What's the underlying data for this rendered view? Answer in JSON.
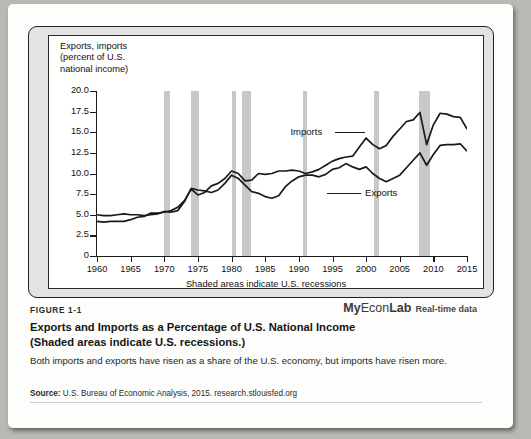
{
  "figure": {
    "number": "FIGURE 1-1",
    "title_line1": "Exports and Imports as a Percentage of U.S. National Income",
    "title_line2": "(Shaded areas indicate U.S. recessions.)",
    "body": "Both imports and exports have risen as a share of the U.S. economy, but imports have risen more.",
    "source_label": "Source:",
    "source_text": " U.S. Bureau of Economic Analysis, 2015. research.stlouisfed.org"
  },
  "branding": {
    "my": "My",
    "econ": "Econ",
    "lab": "Lab",
    "realtime": "Real-time data"
  },
  "chart_data": {
    "type": "line",
    "title": "Exports and Imports as a Percentage of U.S. National Income",
    "axis_title": "Exports, imports\n (percent of U.S.\n national income)",
    "xlabel": "Shaded areas indicate U.S. recessions",
    "ylabel": "",
    "xlim": [
      1960,
      2015
    ],
    "ylim": [
      0,
      20
    ],
    "grid": false,
    "xticks": [
      1960,
      1965,
      1970,
      1975,
      1980,
      1985,
      1990,
      1995,
      2000,
      2005,
      2010,
      2015
    ],
    "xtick_labels": [
      "1960",
      "1965",
      "1970",
      "1975",
      "1980",
      "1985",
      "1990",
      "1995",
      "2000",
      "2005",
      "2010",
      "2015"
    ],
    "yticks": [
      0,
      2.5,
      5.0,
      7.5,
      10.0,
      12.5,
      15.0,
      17.5,
      20.0
    ],
    "ytick_labels": [
      "0",
      "2.5",
      "5.0",
      "7.5",
      "10.0",
      "12.5",
      "15.0",
      "17.5",
      "20.0"
    ],
    "legend_position": "inline-annotations",
    "annotations": [
      {
        "text": "Imports",
        "x": 1995.0,
        "y": 15.0
      },
      {
        "text": "Exports",
        "x": 1994.5,
        "y": 7.6
      }
    ],
    "shaded_regions": [
      {
        "label": "recession",
        "x0": 1969.9,
        "x1": 1970.9
      },
      {
        "label": "recession",
        "x0": 1973.9,
        "x1": 1975.2
      },
      {
        "label": "recession",
        "x0": 1980.1,
        "x1": 1980.6
      },
      {
        "label": "recession",
        "x0": 1981.5,
        "x1": 1982.9
      },
      {
        "label": "recession",
        "x0": 1990.6,
        "x1": 1991.2
      },
      {
        "label": "recession",
        "x0": 2001.2,
        "x1": 2001.9
      },
      {
        "label": "recession",
        "x0": 2007.9,
        "x1": 2009.5
      }
    ],
    "x": [
      1960,
      1961,
      1962,
      1963,
      1964,
      1965,
      1966,
      1967,
      1968,
      1969,
      1970,
      1971,
      1972,
      1973,
      1974,
      1975,
      1976,
      1977,
      1978,
      1979,
      1980,
      1981,
      1982,
      1983,
      1984,
      1985,
      1986,
      1987,
      1988,
      1989,
      1990,
      1991,
      1992,
      1993,
      1994,
      1995,
      1996,
      1997,
      1998,
      1999,
      2000,
      2001,
      2002,
      2003,
      2004,
      2005,
      2006,
      2007,
      2008,
      2009,
      2010,
      2011,
      2012,
      2013,
      2014,
      2015
    ],
    "series": [
      {
        "name": "Exports",
        "values": [
          5.0,
          4.9,
          4.9,
          5.0,
          5.1,
          5.0,
          5.0,
          4.9,
          5.0,
          5.1,
          5.4,
          5.3,
          5.5,
          6.6,
          8.2,
          8.0,
          7.9,
          7.7,
          8.0,
          8.8,
          9.8,
          9.4,
          8.6,
          7.8,
          7.6,
          7.2,
          7.0,
          7.3,
          8.4,
          9.1,
          9.6,
          9.8,
          9.8,
          9.6,
          9.9,
          10.5,
          10.7,
          11.2,
          10.8,
          10.5,
          10.8,
          10.0,
          9.4,
          9.0,
          9.4,
          9.8,
          10.7,
          11.6,
          12.5,
          11.0,
          12.3,
          13.4,
          13.5,
          13.5,
          13.6,
          12.7
        ]
      },
      {
        "name": "Imports",
        "values": [
          4.2,
          4.1,
          4.2,
          4.2,
          4.2,
          4.4,
          4.7,
          4.8,
          5.2,
          5.2,
          5.3,
          5.5,
          5.9,
          6.7,
          8.1,
          7.4,
          7.7,
          8.5,
          8.8,
          9.4,
          10.3,
          10.0,
          9.1,
          9.2,
          10.0,
          9.9,
          10.0,
          10.3,
          10.3,
          10.4,
          10.3,
          10.0,
          10.2,
          10.5,
          11.0,
          11.5,
          11.8,
          12.0,
          12.1,
          13.2,
          14.3,
          13.5,
          13.0,
          13.4,
          14.5,
          15.4,
          16.3,
          16.5,
          17.4,
          13.5,
          15.9,
          17.3,
          17.2,
          16.9,
          16.8,
          15.4
        ]
      }
    ],
    "series_colors": {
      "Exports": "#1a1a1a",
      "Imports": "#1a1a1a"
    }
  }
}
